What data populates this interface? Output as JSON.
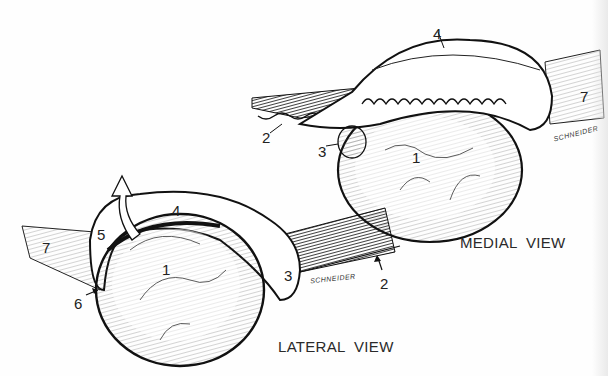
{
  "figure": {
    "medial_view": {
      "caption": "MEDIAL  VIEW",
      "labels": [
        {
          "num": "1",
          "x": 412,
          "y": 150
        },
        {
          "num": "2",
          "x": 262,
          "y": 130
        },
        {
          "num": "3",
          "x": 318,
          "y": 144
        },
        {
          "num": "4",
          "x": 433,
          "y": 26
        },
        {
          "num": "7",
          "x": 580,
          "y": 89
        }
      ],
      "signature": "SCHNEIDER"
    },
    "lateral_view": {
      "caption": "LATERAL  VIEW",
      "labels": [
        {
          "num": "1",
          "x": 162,
          "y": 262
        },
        {
          "num": "2",
          "x": 380,
          "y": 276
        },
        {
          "num": "3",
          "x": 284,
          "y": 268
        },
        {
          "num": "4",
          "x": 172,
          "y": 203
        },
        {
          "num": "5",
          "x": 97,
          "y": 227
        },
        {
          "num": "6",
          "x": 74,
          "y": 296
        },
        {
          "num": "7",
          "x": 42,
          "y": 240
        }
      ],
      "signature": "SCHNEIDER"
    },
    "colors": {
      "ink": "#1a1a1a",
      "paper": "#fefefe"
    }
  }
}
